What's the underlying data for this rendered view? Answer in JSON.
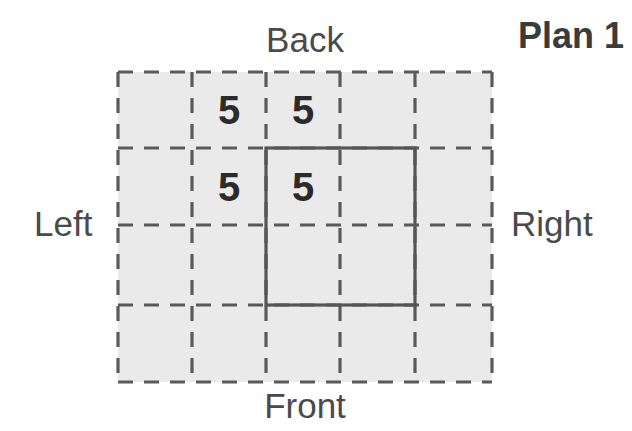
{
  "title": "Plan 1",
  "orientation_labels": {
    "back": "Back",
    "front": "Front",
    "left": "Left",
    "right": "Right"
  },
  "colors": {
    "cell_fill": "#eaeaea",
    "dashed_line": "#5a5a5a",
    "solid_line": "#555555",
    "label_text": "#4a4a4a",
    "title_text": "#3b3b3b",
    "number_text": "#2b2b2b",
    "background": "#ffffff"
  },
  "chart_data": {
    "type": "table",
    "title": "Plan 1",
    "grid": {
      "columns": 5,
      "rows": 4,
      "column_edges_px": [
        0,
        74,
        148,
        222,
        297,
        374
      ],
      "row_edges_px": [
        0,
        76,
        153,
        233,
        310
      ]
    },
    "highlight_region": {
      "label": "solid-outlined-region",
      "col_start": 2,
      "col_end": 4,
      "row_start": 1,
      "row_end": 3,
      "x": 148,
      "y": 76,
      "width": 149,
      "height": 157
    },
    "cells": [
      {
        "row": 1,
        "col": 2,
        "value": "5"
      },
      {
        "row": 1,
        "col": 3,
        "value": "5"
      },
      {
        "row": 2,
        "col": 2,
        "value": "5"
      },
      {
        "row": 2,
        "col": 3,
        "value": "5"
      }
    ],
    "values": [
      5,
      5,
      5,
      5
    ],
    "xlabel": "",
    "ylabel": ""
  }
}
